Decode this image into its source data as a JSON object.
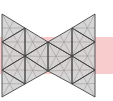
{
  "diagram": {
    "colors": {
      "background": "#ffffff",
      "band": "#f8cccc",
      "fill": "#d3d3d3",
      "edge": "#444444",
      "median": "#9a9a9a"
    },
    "band": {
      "x": 0,
      "y": 37,
      "width": 113,
      "height": 37
    },
    "vertices": {
      "L0": [
        2,
        14
      ],
      "L1": [
        2,
        42
      ],
      "L2": [
        2,
        70
      ],
      "L3": [
        2,
        97
      ],
      "M0": [
        25,
        28
      ],
      "M1": [
        25,
        56
      ],
      "M2": [
        25,
        84
      ],
      "C0": [
        48,
        42
      ],
      "C1": [
        48,
        71
      ],
      "N0": [
        72,
        28
      ],
      "N1": [
        72,
        56
      ],
      "N2": [
        72,
        84
      ],
      "R0": [
        95,
        14
      ],
      "R1": [
        95,
        42
      ],
      "R2": [
        95,
        70
      ],
      "R3": [
        95,
        97
      ]
    },
    "triangles": [
      [
        "L0",
        "M0",
        "L1"
      ],
      [
        "M0",
        "L1",
        "M1"
      ],
      [
        "M0",
        "C0",
        "M1"
      ],
      [
        "L1",
        "M1",
        "L2"
      ],
      [
        "M1",
        "C0",
        "C1"
      ],
      [
        "M1",
        "L2",
        "M2"
      ],
      [
        "M1",
        "C1",
        "M2"
      ],
      [
        "L2",
        "M2",
        "L3"
      ],
      [
        "R0",
        "N0",
        "R1"
      ],
      [
        "N0",
        "R1",
        "N1"
      ],
      [
        "N0",
        "C0",
        "N1"
      ],
      [
        "R1",
        "N1",
        "R2"
      ],
      [
        "N1",
        "C0",
        "C1"
      ],
      [
        "N1",
        "R2",
        "N2"
      ],
      [
        "N1",
        "C1",
        "N2"
      ],
      [
        "R2",
        "N2",
        "R3"
      ]
    ]
  }
}
